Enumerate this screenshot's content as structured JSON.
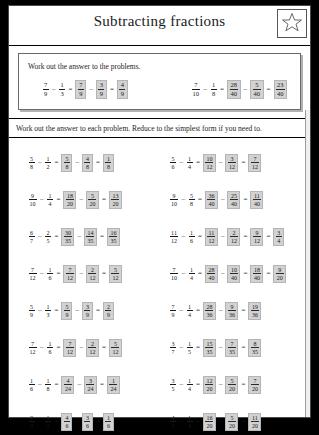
{
  "worksheet": {
    "title": "Subtracting fractions",
    "star_icon": "star-icon",
    "example_panel": {
      "instruction": "Work out the answer to the problems.",
      "examples": [
        {
          "terms": [
            {
              "n": "7",
              "d": "9",
              "boxed": false
            },
            {
              "op": "–"
            },
            {
              "n": "1",
              "d": "3",
              "boxed": false
            },
            {
              "op": "="
            },
            {
              "n": "7",
              "d": "9",
              "boxed": true
            },
            {
              "op": "–"
            },
            {
              "n": "3",
              "d": "9",
              "boxed": true
            },
            {
              "op": "="
            },
            {
              "n": "4",
              "d": "9",
              "boxed": true
            }
          ]
        },
        {
          "terms": [
            {
              "n": "7",
              "d": "10",
              "boxed": false
            },
            {
              "op": "–"
            },
            {
              "n": "1",
              "d": "8",
              "boxed": false
            },
            {
              "op": "="
            },
            {
              "n": "28",
              "d": "40",
              "boxed": true
            },
            {
              "op": "–"
            },
            {
              "n": "5",
              "d": "40",
              "boxed": true
            },
            {
              "op": "="
            },
            {
              "n": "23",
              "d": "40",
              "boxed": true
            }
          ]
        }
      ]
    },
    "main_instruction": "Work out the answer to each problem. Reduce to the simplest form if you need to.",
    "problems": [
      {
        "terms": [
          {
            "n": "5",
            "d": "8",
            "boxed": false
          },
          {
            "op": "–"
          },
          {
            "n": "1",
            "d": "2",
            "boxed": false
          },
          {
            "op": "="
          },
          {
            "n": "5",
            "d": "8",
            "boxed": true
          },
          {
            "op": "–"
          },
          {
            "n": "4",
            "d": "8",
            "boxed": true
          },
          {
            "op": "="
          },
          {
            "n": "1",
            "d": "8",
            "boxed": true
          }
        ]
      },
      {
        "terms": [
          {
            "n": "5",
            "d": "6",
            "boxed": false
          },
          {
            "op": "–"
          },
          {
            "n": "1",
            "d": "4",
            "boxed": false
          },
          {
            "op": "="
          },
          {
            "n": "10",
            "d": "12",
            "boxed": true
          },
          {
            "op": "–"
          },
          {
            "n": "3",
            "d": "12",
            "boxed": true
          },
          {
            "op": "="
          },
          {
            "n": "7",
            "d": "12",
            "boxed": true
          }
        ]
      },
      {
        "terms": [
          {
            "n": "9",
            "d": "10",
            "boxed": false
          },
          {
            "op": "–"
          },
          {
            "n": "1",
            "d": "4",
            "boxed": false
          },
          {
            "op": "="
          },
          {
            "n": "18",
            "d": "20",
            "boxed": true
          },
          {
            "op": "–"
          },
          {
            "n": "5",
            "d": "20",
            "boxed": true
          },
          {
            "op": "="
          },
          {
            "n": "13",
            "d": "20",
            "boxed": true
          }
        ]
      },
      {
        "terms": [
          {
            "n": "9",
            "d": "10",
            "boxed": false
          },
          {
            "op": "–"
          },
          {
            "n": "5",
            "d": "8",
            "boxed": false
          },
          {
            "op": "="
          },
          {
            "n": "36",
            "d": "40",
            "boxed": true
          },
          {
            "op": "–"
          },
          {
            "n": "25",
            "d": "40",
            "boxed": true
          },
          {
            "op": "="
          },
          {
            "n": "11",
            "d": "40",
            "boxed": true
          }
        ]
      },
      {
        "terms": [
          {
            "n": "6",
            "d": "7",
            "boxed": false
          },
          {
            "op": "–"
          },
          {
            "n": "2",
            "d": "5",
            "boxed": false
          },
          {
            "op": "="
          },
          {
            "n": "30",
            "d": "35",
            "boxed": true
          },
          {
            "op": "–"
          },
          {
            "n": "14",
            "d": "35",
            "boxed": true
          },
          {
            "op": "="
          },
          {
            "n": "16",
            "d": "35",
            "boxed": true
          }
        ]
      },
      {
        "terms": [
          {
            "n": "11",
            "d": "12",
            "boxed": false
          },
          {
            "op": "–"
          },
          {
            "n": "1",
            "d": "6",
            "boxed": false
          },
          {
            "op": "="
          },
          {
            "n": "11",
            "d": "12",
            "boxed": true
          },
          {
            "op": "–"
          },
          {
            "n": "2",
            "d": "12",
            "boxed": true
          },
          {
            "op": "="
          },
          {
            "n": "9",
            "d": "12",
            "boxed": true
          },
          {
            "op": "="
          },
          {
            "n": "3",
            "d": "4",
            "boxed": true
          }
        ]
      },
      {
        "terms": [
          {
            "n": "7",
            "d": "12",
            "boxed": false
          },
          {
            "op": "–"
          },
          {
            "n": "1",
            "d": "6",
            "boxed": false
          },
          {
            "op": "="
          },
          {
            "n": "7",
            "d": "12",
            "boxed": true
          },
          {
            "op": "–"
          },
          {
            "n": "2",
            "d": "12",
            "boxed": true
          },
          {
            "op": "="
          },
          {
            "n": "5",
            "d": "12",
            "boxed": true
          }
        ]
      },
      {
        "terms": [
          {
            "n": "7",
            "d": "10",
            "boxed": false
          },
          {
            "op": "–"
          },
          {
            "n": "1",
            "d": "4",
            "boxed": false
          },
          {
            "op": "="
          },
          {
            "n": "28",
            "d": "40",
            "boxed": true
          },
          {
            "op": "–"
          },
          {
            "n": "10",
            "d": "40",
            "boxed": true
          },
          {
            "op": "="
          },
          {
            "n": "18",
            "d": "40",
            "boxed": true
          },
          {
            "op": "="
          },
          {
            "n": "9",
            "d": "20",
            "boxed": true
          }
        ]
      },
      {
        "terms": [
          {
            "n": "5",
            "d": "9",
            "boxed": false
          },
          {
            "op": "–"
          },
          {
            "n": "1",
            "d": "3",
            "boxed": false
          },
          {
            "op": "="
          },
          {
            "n": "5",
            "d": "9",
            "boxed": true
          },
          {
            "op": "–"
          },
          {
            "n": "3",
            "d": "9",
            "boxed": true
          },
          {
            "op": "="
          },
          {
            "n": "2",
            "d": "9",
            "boxed": true
          }
        ]
      },
      {
        "terms": [
          {
            "n": "7",
            "d": "9",
            "boxed": false
          },
          {
            "op": "–"
          },
          {
            "n": "1",
            "d": "4",
            "boxed": false
          },
          {
            "op": "="
          },
          {
            "n": "28",
            "d": "36",
            "boxed": true
          },
          {
            "op": "–"
          },
          {
            "n": "9",
            "d": "36",
            "boxed": true
          },
          {
            "op": "="
          },
          {
            "n": "19",
            "d": "36",
            "boxed": true
          }
        ]
      },
      {
        "terms": [
          {
            "n": "7",
            "d": "12",
            "boxed": false
          },
          {
            "op": "–"
          },
          {
            "n": "1",
            "d": "6",
            "boxed": false
          },
          {
            "op": "="
          },
          {
            "n": "7",
            "d": "12",
            "boxed": true
          },
          {
            "op": "–"
          },
          {
            "n": "2",
            "d": "12",
            "boxed": true
          },
          {
            "op": "="
          },
          {
            "n": "5",
            "d": "12",
            "boxed": true
          }
        ]
      },
      {
        "terms": [
          {
            "n": "3",
            "d": "7",
            "boxed": false
          },
          {
            "op": "–"
          },
          {
            "n": "1",
            "d": "5",
            "boxed": false
          },
          {
            "op": "="
          },
          {
            "n": "15",
            "d": "35",
            "boxed": true
          },
          {
            "op": "–"
          },
          {
            "n": "7",
            "d": "35",
            "boxed": true
          },
          {
            "op": "="
          },
          {
            "n": "8",
            "d": "35",
            "boxed": true
          }
        ]
      },
      {
        "terms": [
          {
            "n": "1",
            "d": "6",
            "boxed": false
          },
          {
            "op": "–"
          },
          {
            "n": "1",
            "d": "8",
            "boxed": false
          },
          {
            "op": "="
          },
          {
            "n": "4",
            "d": "24",
            "boxed": true
          },
          {
            "op": "–"
          },
          {
            "n": "3",
            "d": "24",
            "boxed": true
          },
          {
            "op": "="
          },
          {
            "n": "1",
            "d": "24",
            "boxed": true
          }
        ]
      },
      {
        "terms": [
          {
            "n": "3",
            "d": "5",
            "boxed": false
          },
          {
            "op": "–"
          },
          {
            "n": "1",
            "d": "4",
            "boxed": false
          },
          {
            "op": "="
          },
          {
            "n": "12",
            "d": "20",
            "boxed": true
          },
          {
            "op": "–"
          },
          {
            "n": "5",
            "d": "20",
            "boxed": true
          },
          {
            "op": "="
          },
          {
            "n": "7",
            "d": "20",
            "boxed": true
          }
        ]
      },
      {
        "terms": [
          {
            "n": "2",
            "d": "3",
            "boxed": false
          },
          {
            "op": "–"
          },
          {
            "n": "1",
            "d": "2",
            "boxed": false
          },
          {
            "op": "="
          },
          {
            "n": "4",
            "d": "6",
            "boxed": true
          },
          {
            "op": "–"
          },
          {
            "n": "3",
            "d": "6",
            "boxed": true
          },
          {
            "op": "="
          },
          {
            "n": "1",
            "d": "6",
            "boxed": true
          }
        ]
      },
      {
        "terms": [
          {
            "n": "4",
            "d": "5",
            "boxed": false
          },
          {
            "op": "–"
          },
          {
            "n": "1",
            "d": "4",
            "boxed": false
          },
          {
            "op": "="
          },
          {
            "n": "16",
            "d": "20",
            "boxed": true
          },
          {
            "op": "–"
          },
          {
            "n": "5",
            "d": "20",
            "boxed": true
          },
          {
            "op": "="
          },
          {
            "n": "11",
            "d": "20",
            "boxed": true
          }
        ]
      }
    ]
  },
  "colors": {
    "answer_fill": "#d2d2d2",
    "page": "#ffffff",
    "ink": "#1a1a1a",
    "backdrop": "#000000"
  }
}
